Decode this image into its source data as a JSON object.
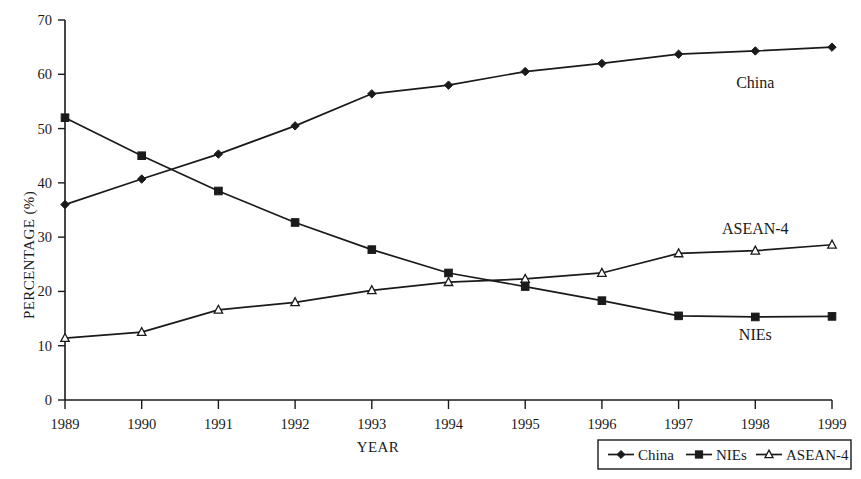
{
  "chart_data": {
    "type": "line",
    "title": "",
    "xlabel": "YEAR",
    "ylabel": "PERCENTAGE (%)",
    "x": [
      1989,
      1990,
      1991,
      1992,
      1993,
      1994,
      1995,
      1996,
      1997,
      1998,
      1999
    ],
    "xtick_labels": [
      "1989",
      "1990",
      "1991",
      "1992",
      "1993",
      "1994",
      "1995",
      "1996",
      "1997",
      "1998",
      "1999"
    ],
    "ytick_labels": [
      "0",
      "10",
      "20",
      "30",
      "40",
      "50",
      "60",
      "70"
    ],
    "yticks": [
      0,
      10,
      20,
      30,
      40,
      50,
      60,
      70
    ],
    "ylim": [
      0,
      70
    ],
    "xlim": [
      1989,
      1999
    ],
    "grid": false,
    "legend_position": "bottom-right",
    "series": [
      {
        "name": "China",
        "marker": "diamond-filled",
        "color": "#1a1a1a",
        "values": [
          36.0,
          40.7,
          45.3,
          50.5,
          56.4,
          58.0,
          60.5,
          62.0,
          63.7,
          64.3,
          65.0
        ]
      },
      {
        "name": "NIEs",
        "marker": "square-filled",
        "color": "#1a1a1a",
        "values": [
          52.0,
          45.0,
          38.5,
          32.7,
          27.7,
          23.4,
          20.9,
          18.3,
          15.5,
          15.3,
          15.4
        ]
      },
      {
        "name": "ASEAN-4",
        "marker": "triangle-hollow",
        "color": "#1a1a1a",
        "values": [
          11.4,
          12.5,
          16.6,
          18.0,
          20.2,
          21.7,
          22.3,
          23.4,
          27.0,
          27.5,
          28.6
        ]
      }
    ],
    "annotations": [
      {
        "text": "China",
        "series": "China",
        "x": 1998,
        "y": 57.5
      },
      {
        "text": "ASEAN-4",
        "series": "ASEAN-4",
        "x": 1998,
        "y": 30.5
      },
      {
        "text": "NIEs",
        "series": "NIEs",
        "x": 1998,
        "y": 11.0
      }
    ]
  },
  "legend": {
    "entries": [
      {
        "label": "China",
        "marker": "diamond-filled"
      },
      {
        "label": "NIEs",
        "marker": "square-filled"
      },
      {
        "label": "ASEAN-4",
        "marker": "triangle-hollow"
      }
    ]
  }
}
